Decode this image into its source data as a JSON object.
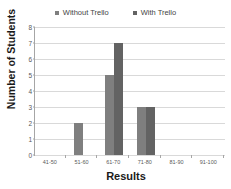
{
  "chart_data": {
    "type": "bar",
    "title": "",
    "xlabel": "Results",
    "ylabel": "Number of Students",
    "categories": [
      "41-50",
      "51-60",
      "61-70",
      "71-80",
      "81-90",
      "91-100"
    ],
    "series": [
      {
        "name": "Without Trello",
        "color": "#7f7f7f",
        "values": [
          0,
          2,
          5,
          3,
          0,
          0
        ]
      },
      {
        "name": "With Trello",
        "color": "#636363",
        "values": [
          0,
          0,
          7,
          3,
          0,
          0
        ]
      }
    ],
    "ylim": [
      0,
      8
    ],
    "yticks": [
      0,
      1,
      2,
      3,
      4,
      5,
      6,
      7,
      8
    ],
    "grid": true,
    "legend_position": "top"
  },
  "legend": {
    "entries": [
      {
        "label": "Without Trello",
        "swatch_color": "#7f7f7f"
      },
      {
        "label": "With Trello",
        "swatch_color": "#636363"
      }
    ]
  },
  "axes": {
    "y_title": "Number of Students",
    "x_title": "Results",
    "y_tick_labels": [
      "8",
      "7",
      "6",
      "5",
      "4",
      "3",
      "2",
      "1",
      "0"
    ],
    "x_tick_labels": [
      "41-50",
      "51-60",
      "61-70",
      "71-80",
      "81-90",
      "91-100"
    ]
  },
  "colors": {
    "series_without": "#7f7f7f",
    "series_with": "#636363",
    "gridline": "#d9d9d9",
    "axis": "#a6a6a6",
    "background": "#ffffff"
  }
}
